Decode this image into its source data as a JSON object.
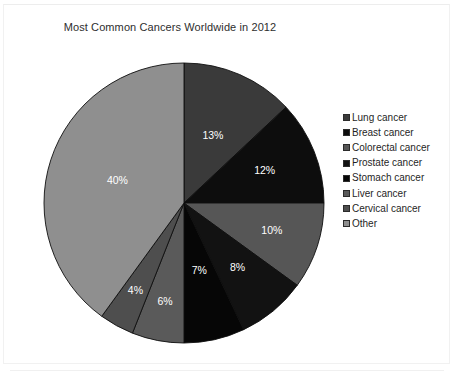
{
  "chart_data": {
    "type": "pie",
    "title": "Most Common Cancers Worldwide in 2012",
    "xlabel": "",
    "ylabel": "",
    "legend_position": "right",
    "grid": false,
    "value_suffix": "%",
    "categories": [
      "Lung cancer",
      "Breast cancer",
      "Colorectal cancer",
      "Prostate cancer",
      "Stomach cancer",
      "Liver cancer",
      "Cervical cancer",
      "Other"
    ],
    "values": [
      13,
      12,
      10,
      8,
      7,
      6,
      4,
      40
    ],
    "slices": [
      {
        "label": "Lung cancer",
        "value": 13,
        "display": "13%",
        "color": "#3a3a3a"
      },
      {
        "label": "Breast cancer",
        "value": 12,
        "display": "12%",
        "color": "#0d0d0d"
      },
      {
        "label": "Colorectal cancer",
        "value": 10,
        "display": "10%",
        "color": "#565656"
      },
      {
        "label": "Prostate cancer",
        "value": 8,
        "display": "8%",
        "color": "#121212"
      },
      {
        "label": "Stomach cancer",
        "value": 7,
        "display": "7%",
        "color": "#060606"
      },
      {
        "label": "Liver cancer",
        "value": 6,
        "display": "6%",
        "color": "#5a5a5a"
      },
      {
        "label": "Cervical cancer",
        "value": 4,
        "display": "4%",
        "color": "#4e4e4e"
      },
      {
        "label": "Other",
        "value": 40,
        "display": "40%",
        "color": "#8f8f8f"
      }
    ],
    "total": 100
  },
  "legend": {
    "items": [
      {
        "label": "Lung cancer",
        "color": "#3a3a3a"
      },
      {
        "label": "Breast cancer",
        "color": "#0d0d0d"
      },
      {
        "label": "Colorectal cancer",
        "color": "#565656"
      },
      {
        "label": "Prostate cancer",
        "color": "#121212"
      },
      {
        "label": "Stomach cancer",
        "color": "#060606"
      },
      {
        "label": "Liver cancer",
        "color": "#5a5a5a"
      },
      {
        "label": "Cervical cancer",
        "color": "#4e4e4e"
      },
      {
        "label": "Other",
        "color": "#8f8f8f"
      }
    ]
  }
}
